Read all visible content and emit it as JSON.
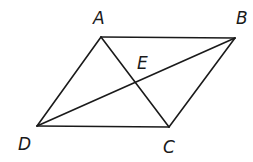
{
  "diagram": {
    "type": "parallelogram-with-diagonals",
    "colors": {
      "stroke": "#1a1a1a",
      "background": "#ffffff"
    },
    "points": {
      "A": {
        "label": "A",
        "x": 101,
        "y": 37,
        "lx": 93,
        "ly": 24
      },
      "B": {
        "label": "B",
        "x": 235,
        "y": 38,
        "lx": 236,
        "ly": 24
      },
      "C": {
        "label": "C",
        "x": 169,
        "y": 127,
        "lx": 163,
        "ly": 153
      },
      "D": {
        "label": "D",
        "x": 37,
        "y": 126,
        "lx": 18,
        "ly": 150
      },
      "E": {
        "label": "E",
        "x": 135,
        "y": 82,
        "lx": 137,
        "ly": 69
      }
    },
    "segments": [
      {
        "from": "A",
        "to": "B"
      },
      {
        "from": "B",
        "to": "C"
      },
      {
        "from": "C",
        "to": "D"
      },
      {
        "from": "D",
        "to": "A"
      },
      {
        "from": "A",
        "to": "C"
      },
      {
        "from": "D",
        "to": "B"
      }
    ]
  }
}
